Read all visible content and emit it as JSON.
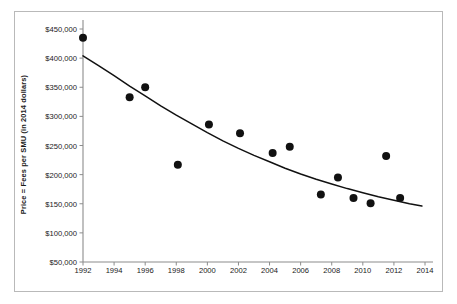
{
  "chart_data": {
    "type": "scatter",
    "title": "",
    "xlabel": "",
    "ylabel": "Price = Fees per SMU (in 2014 dollars)",
    "xlim": [
      1991.2,
      2015.0
    ],
    "ylim": [
      50000,
      450000
    ],
    "grid": false,
    "legend": null,
    "x_ticks": [
      1992,
      1994,
      1996,
      1998,
      2000,
      2002,
      2004,
      2006,
      2008,
      2010,
      2012,
      2014
    ],
    "x_tick_labels": [
      "1992",
      "1994",
      "1996",
      "1998",
      "2000",
      "2002",
      "2004",
      "2006",
      "2008",
      "2010",
      "2012",
      "2014"
    ],
    "y_ticks": [
      50000,
      100000,
      150000,
      200000,
      250000,
      300000,
      350000,
      400000,
      450000
    ],
    "y_tick_labels": [
      "$50,000",
      "$100,000",
      "$150,000",
      "$200,000",
      "$250,000",
      "$300,000",
      "$350,000",
      "$400,000",
      "$450,000"
    ],
    "series": [
      {
        "name": "Price per SMU",
        "marker": "circle",
        "color": "#111111",
        "points": [
          {
            "x": 1992.0,
            "y": 435000
          },
          {
            "x": 1995.0,
            "y": 333000
          },
          {
            "x": 1996.0,
            "y": 350000
          },
          {
            "x": 1998.1,
            "y": 217000
          },
          {
            "x": 2000.1,
            "y": 286000
          },
          {
            "x": 2002.1,
            "y": 271000
          },
          {
            "x": 2004.2,
            "y": 237000
          },
          {
            "x": 2005.3,
            "y": 248000
          },
          {
            "x": 2007.3,
            "y": 166000
          },
          {
            "x": 2008.4,
            "y": 195000
          },
          {
            "x": 2009.4,
            "y": 160000
          },
          {
            "x": 2010.5,
            "y": 151000
          },
          {
            "x": 2011.5,
            "y": 232000
          },
          {
            "x": 2012.4,
            "y": 160000
          }
        ]
      }
    ],
    "trendline": {
      "name": "fitted exponential decay trend",
      "color": "#111111",
      "points": [
        {
          "x": 1992.0,
          "y": 404000
        },
        {
          "x": 1993.0,
          "y": 387000
        },
        {
          "x": 1994.0,
          "y": 370000
        },
        {
          "x": 1995.0,
          "y": 352000
        },
        {
          "x": 1996.0,
          "y": 335000
        },
        {
          "x": 1997.0,
          "y": 318000
        },
        {
          "x": 1998.0,
          "y": 302000
        },
        {
          "x": 1999.0,
          "y": 287000
        },
        {
          "x": 2000.0,
          "y": 272000
        },
        {
          "x": 2001.0,
          "y": 258000
        },
        {
          "x": 2002.0,
          "y": 245000
        },
        {
          "x": 2003.0,
          "y": 233000
        },
        {
          "x": 2004.0,
          "y": 222000
        },
        {
          "x": 2005.0,
          "y": 211000
        },
        {
          "x": 2006.0,
          "y": 201000
        },
        {
          "x": 2007.0,
          "y": 192000
        },
        {
          "x": 2008.0,
          "y": 184000
        },
        {
          "x": 2009.0,
          "y": 176000
        },
        {
          "x": 2010.0,
          "y": 169000
        },
        {
          "x": 2011.0,
          "y": 162000
        },
        {
          "x": 2012.0,
          "y": 156000
        },
        {
          "x": 2013.0,
          "y": 150000
        },
        {
          "x": 2013.8,
          "y": 146000
        }
      ]
    }
  },
  "axis": {
    "y_axis_line_color": "#8c8c8c",
    "x_axis_line_color": "#8c8c8c"
  },
  "frame": {
    "border_color": "#b9b9b9",
    "background": "#ffffff"
  }
}
